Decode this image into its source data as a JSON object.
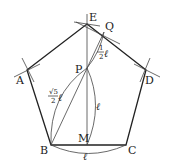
{
  "diagram": {
    "stroke_color": "#222222",
    "points": {
      "E": {
        "label": "E",
        "x": 87,
        "y": 24
      },
      "Q": {
        "label": "Q",
        "x": 104,
        "y": 32
      },
      "A": {
        "label": "A",
        "x": 27,
        "y": 70
      },
      "D": {
        "label": "D",
        "x": 146,
        "y": 70
      },
      "P": {
        "label": "P",
        "x": 87,
        "y": 68
      },
      "B": {
        "label": "B",
        "x": 51,
        "y": 145
      },
      "M": {
        "label": "M",
        "x": 87,
        "y": 145
      },
      "C": {
        "label": "C",
        "x": 126,
        "y": 145
      }
    },
    "annotations": {
      "pq_num": "1",
      "pq_den": "2",
      "pq_var": "ℓ",
      "bp_num": "√5",
      "bp_den": "2",
      "bp_var": "ℓ",
      "pm_label": "ℓ",
      "bc_label": "ℓ"
    }
  }
}
